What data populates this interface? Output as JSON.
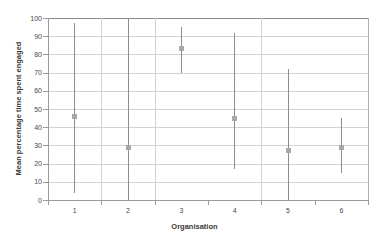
{
  "chart_data": {
    "type": "scatter",
    "title": "",
    "xlabel": "Organisation",
    "ylabel": "Mean percentage time spent engaged",
    "categories": [
      "1",
      "2",
      "3",
      "4",
      "5",
      "6"
    ],
    "values": [
      46,
      29,
      83,
      45,
      27,
      29
    ],
    "error_low": [
      4,
      0,
      70,
      17,
      0,
      15
    ],
    "error_high": [
      97,
      100,
      95,
      92,
      72,
      45
    ],
    "series": [
      {
        "name": "Mean percentage time spent engaged",
        "values": [
          46,
          29,
          83,
          45,
          27,
          29
        ],
        "error_low": [
          4,
          0,
          70,
          17,
          0,
          15
        ],
        "error_high": [
          97,
          100,
          95,
          92,
          72,
          45
        ]
      }
    ],
    "ylim": [
      0,
      100
    ],
    "ytick_labels": [
      "0",
      "10",
      "20",
      "30",
      "40",
      "50",
      "60",
      "70",
      "80",
      "90",
      "100"
    ],
    "ytick_values": [
      0,
      10,
      20,
      30,
      40,
      50,
      60,
      70,
      80,
      90,
      100
    ],
    "grid": true,
    "legend": false,
    "marker_color": "#a8a8a8",
    "errorbar_color": "#8c8c8c",
    "gridline_color": "#d2d2d2",
    "background_color": "#ffffff"
  }
}
